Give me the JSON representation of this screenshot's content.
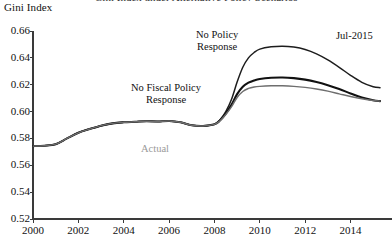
{
  "chart_data": {
    "type": "line",
    "title": "Gini Index under Alternative Policy Scenarios",
    "title_clipped": true,
    "ylabel": "Gini Index",
    "xlabel": "",
    "grid": false,
    "legend_position": "inline-annotations",
    "xlim": [
      2000,
      2015.3
    ],
    "ylim": [
      0.52,
      0.66
    ],
    "ytick_labels": [
      "0.66",
      "0.64",
      "0.62",
      "0.60",
      "0.58",
      "0.56",
      "0.54",
      "0.52"
    ],
    "ytick_values": [
      0.66,
      0.64,
      0.62,
      0.6,
      0.58,
      0.56,
      0.54,
      0.52
    ],
    "xtick_labels": [
      "2000",
      "2002",
      "2004",
      "2006",
      "2008",
      "2010",
      "2012",
      "2014"
    ],
    "xtick_values": [
      2000,
      2002,
      2004,
      2006,
      2008,
      2010,
      2012,
      2014
    ],
    "series": [
      {
        "name": "No Policy Response",
        "color": "#1d1d1d",
        "width": 1.5,
        "x": [
          2000.0,
          2000.5,
          2001.0,
          2001.5,
          2002.0,
          2002.5,
          2003.0,
          2003.5,
          2004.0,
          2004.5,
          2005.0,
          2005.5,
          2006.0,
          2006.5,
          2007.0,
          2007.5,
          2008.0,
          2008.25,
          2008.5,
          2008.75,
          2009.0,
          2009.25,
          2009.5,
          2009.75,
          2010.0,
          2010.5,
          2011.0,
          2011.5,
          2012.0,
          2012.5,
          2013.0,
          2013.5,
          2014.0,
          2014.5,
          2015.0,
          2015.3
        ],
        "y": [
          0.5743,
          0.5746,
          0.5757,
          0.58,
          0.5842,
          0.587,
          0.5895,
          0.5912,
          0.592,
          0.5924,
          0.5928,
          0.5926,
          0.593,
          0.592,
          0.5898,
          0.5893,
          0.5905,
          0.594,
          0.6,
          0.609,
          0.622,
          0.633,
          0.64,
          0.644,
          0.6465,
          0.6482,
          0.6487,
          0.648,
          0.6462,
          0.643,
          0.6385,
          0.633,
          0.627,
          0.6218,
          0.6185,
          0.6178
        ]
      },
      {
        "name": "No Fiscal Policy Response",
        "color": "#111111",
        "width": 2.1,
        "x": [
          2000.0,
          2000.5,
          2001.0,
          2001.5,
          2002.0,
          2002.5,
          2003.0,
          2003.5,
          2004.0,
          2004.5,
          2005.0,
          2005.5,
          2006.0,
          2006.5,
          2007.0,
          2007.5,
          2008.0,
          2008.25,
          2008.5,
          2008.75,
          2009.0,
          2009.25,
          2009.5,
          2009.75,
          2010.0,
          2010.5,
          2011.0,
          2011.5,
          2012.0,
          2012.5,
          2013.0,
          2013.5,
          2014.0,
          2014.5,
          2015.0,
          2015.3
        ],
        "y": [
          0.5743,
          0.5746,
          0.5757,
          0.58,
          0.5842,
          0.587,
          0.5895,
          0.5912,
          0.592,
          0.5924,
          0.5928,
          0.5926,
          0.593,
          0.592,
          0.5898,
          0.5893,
          0.5905,
          0.5935,
          0.5985,
          0.605,
          0.613,
          0.6185,
          0.6215,
          0.6232,
          0.6243,
          0.6252,
          0.6254,
          0.6249,
          0.6238,
          0.622,
          0.6196,
          0.6168,
          0.6135,
          0.6105,
          0.6085,
          0.6078
        ]
      },
      {
        "name": "Actual",
        "color": "#6e6e6e",
        "width": 1.4,
        "x": [
          2000.0,
          2000.5,
          2001.0,
          2001.5,
          2002.0,
          2002.5,
          2003.0,
          2003.5,
          2004.0,
          2004.5,
          2005.0,
          2005.5,
          2006.0,
          2006.5,
          2007.0,
          2007.5,
          2008.0,
          2008.25,
          2008.5,
          2008.75,
          2009.0,
          2009.25,
          2009.5,
          2009.75,
          2010.0,
          2010.5,
          2011.0,
          2011.5,
          2012.0,
          2012.5,
          2013.0,
          2013.5,
          2014.0,
          2014.5,
          2015.0,
          2015.3
        ],
        "y": [
          0.5743,
          0.5746,
          0.5757,
          0.58,
          0.5842,
          0.587,
          0.5895,
          0.5912,
          0.592,
          0.5924,
          0.5928,
          0.5926,
          0.593,
          0.592,
          0.5898,
          0.5893,
          0.5905,
          0.5932,
          0.5978,
          0.6035,
          0.6105,
          0.615,
          0.6172,
          0.6183,
          0.6188,
          0.6192,
          0.6192,
          0.6188,
          0.618,
          0.6168,
          0.6152,
          0.6132,
          0.6112,
          0.6095,
          0.6082,
          0.6078
        ]
      }
    ],
    "annotations": [
      {
        "id": "no-policy-response",
        "text": "No Policy\nResponse",
        "x_px": 196,
        "y_px": 29,
        "style": "dark"
      },
      {
        "id": "no-fiscal-policy-response",
        "text": "No Fiscal Policy\nResponse",
        "x_px": 131,
        "y_px": 82,
        "style": "dark"
      },
      {
        "id": "actual",
        "text": "Actual",
        "x_px": 141,
        "y_px": 143,
        "style": "muted"
      },
      {
        "id": "jul-2015",
        "text": "Jul-2015",
        "x_px": 336,
        "y_px": 30,
        "style": "dark"
      }
    ]
  },
  "layout": {
    "plot_left_px": 33,
    "plot_right_px": 380,
    "plot_top_px": 31,
    "plot_bottom_px": 219
  }
}
